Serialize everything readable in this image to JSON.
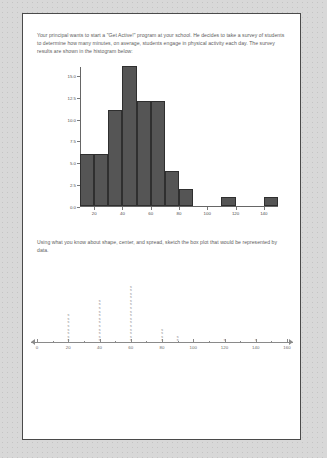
{
  "page": {
    "prompt_1": "Your principal wants to start a \"Get Active!\" program at your school.  He decides to take a survey of students to determine how many minutes, on average, students engage in physical activity each day.  The survey results are shown in the histogram below:",
    "prompt_2": "Using what you know about shape, center, and spread, sketch the box plot that would be represented by data."
  },
  "chart_data": [
    {
      "type": "bar",
      "title": "",
      "xlabel": "",
      "ylabel": "",
      "grid": false,
      "legend": null,
      "xlim": [
        10,
        150
      ],
      "ylim": [
        0.0,
        16.0
      ],
      "bin_width": 10,
      "bin_starts": [
        10,
        20,
        30,
        40,
        50,
        60,
        70,
        80,
        90,
        100,
        110,
        120,
        130,
        140
      ],
      "categories": [
        "10-20",
        "20-30",
        "30-40",
        "40-50",
        "50-60",
        "60-70",
        "70-80",
        "80-90",
        "90-100",
        "100-110",
        "110-120",
        "120-130",
        "130-140",
        "140-150"
      ],
      "values": [
        6,
        6,
        11,
        16,
        12,
        12,
        4,
        2,
        0,
        0,
        1,
        0,
        0,
        1
      ],
      "ytick_labels": [
        "0.0",
        "2.5",
        "5.0",
        "7.5",
        "10.0",
        "12.5",
        "15.0"
      ],
      "ytick_values": [
        0.0,
        2.5,
        5.0,
        7.5,
        10.0,
        12.5,
        15.0
      ],
      "xtick_labels": [
        "20",
        "40",
        "60",
        "80",
        "100",
        "120",
        "140"
      ],
      "xtick_values": [
        20,
        40,
        60,
        80,
        100,
        120,
        140
      ],
      "bar_color": "#555555"
    },
    {
      "type": "scatter",
      "title": "",
      "xlabel": "",
      "ylabel": "",
      "grid": false,
      "legend": null,
      "xlim": [
        0,
        160
      ],
      "marker": "x",
      "marker_color": "#8d8d8d",
      "xtick_labels": [
        "0",
        "20",
        "40",
        "60",
        "80",
        "100",
        "120",
        "140",
        "160"
      ],
      "xtick_values": [
        0,
        20,
        40,
        60,
        80,
        100,
        120,
        140,
        160
      ],
      "minor_tick_values": [
        10,
        30,
        50,
        70,
        90,
        110,
        130,
        150
      ],
      "x": [
        20,
        40,
        60,
        80,
        90,
        120,
        140
      ],
      "counts": [
        8,
        12,
        16,
        4,
        2,
        1,
        1
      ]
    }
  ]
}
